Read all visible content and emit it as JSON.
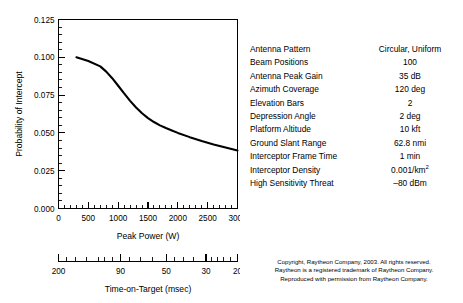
{
  "chart_data": {
    "type": "line",
    "title": "",
    "xlabel": "Peak Power (W)",
    "ylabel": "Probability of Intercept",
    "secondary_xlabel": "Time-on-Target (msec)",
    "xlim": [
      0,
      3000
    ],
    "ylim": [
      0,
      0.125
    ],
    "grid": false,
    "legend": null,
    "x_ticks": [
      "0",
      "500",
      "1000",
      "1500",
      "2000",
      "2500",
      "3000"
    ],
    "x_tick_values": [
      0,
      500,
      1000,
      1500,
      2000,
      2500,
      3000
    ],
    "y_ticks": [
      "0.000",
      "0.025",
      "0.050",
      "0.075",
      "0.100",
      "0.125"
    ],
    "y_tick_values": [
      0,
      0.025,
      0.05,
      0.075,
      0.1,
      0.125
    ],
    "secondary_x_ticks": [
      "200",
      "90",
      "50",
      "30",
      "20"
    ],
    "secondary_x_tick_values": [
      200,
      90,
      50,
      30,
      20
    ],
    "series": [
      {
        "name": "Probability of Intercept",
        "x": [
          300,
          500,
          700,
          800,
          900,
          1000,
          1100,
          1200,
          1300,
          1400,
          1500,
          1600,
          1700,
          1800,
          1900,
          2000,
          2200,
          2400,
          2600,
          2800,
          3000
        ],
        "y": [
          0.1,
          0.0975,
          0.094,
          0.0905,
          0.0862,
          0.0812,
          0.0762,
          0.0712,
          0.0668,
          0.063,
          0.0598,
          0.0572,
          0.055,
          0.0532,
          0.0516,
          0.05,
          0.0472,
          0.0447,
          0.0424,
          0.0403,
          0.0383
        ]
      }
    ]
  },
  "parameters": {
    "rows": [
      {
        "label": "Antenna Pattern",
        "value": "Circular, Uniform"
      },
      {
        "label": "Beam Positions",
        "value": "100"
      },
      {
        "label": "Antenna Peak Gain",
        "value": "35 dB"
      },
      {
        "label": "Azimuth Coverage",
        "value": "120 deg"
      },
      {
        "label": "Elevation Bars",
        "value": "2"
      },
      {
        "label": "Depression Angle",
        "value": "2 deg"
      },
      {
        "label": "Platform Altitude",
        "value": "10 kft"
      },
      {
        "label": "Ground Slant Range",
        "value": "62.8 nmi"
      },
      {
        "label": "Interceptor Frame Time",
        "value": "1 min"
      },
      {
        "label": "Interceptor Density",
        "value": "0.001/km",
        "sup": "2"
      },
      {
        "label": "High Sensitivity Threat",
        "value": "–80 dBm"
      }
    ]
  },
  "copyright": {
    "line1": "Copyright, Raytheon Company, 2003. All rights reserved.",
    "line2": "Raytheon is a registered trademark of Raytheon Company.",
    "line3": "Reproduced with permission from Raytheon Company."
  },
  "colors": {
    "ink": "#000000",
    "background": "#ffffff"
  }
}
